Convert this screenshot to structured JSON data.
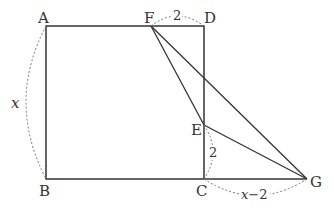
{
  "diagram": {
    "type": "geometry",
    "points": {
      "A": {
        "label": "A",
        "x": 46,
        "y": 26
      },
      "D": {
        "label": "D",
        "x": 204,
        "y": 26
      },
      "B": {
        "label": "B",
        "x": 46,
        "y": 179
      },
      "C": {
        "label": "C",
        "x": 204,
        "y": 179
      },
      "F": {
        "label": "F",
        "x": 151,
        "y": 26
      },
      "E": {
        "label": "E",
        "x": 204,
        "y": 125
      },
      "G": {
        "label": "G",
        "x": 307,
        "y": 179
      }
    },
    "measures": {
      "AB": "x",
      "FD": "2",
      "EC": "2",
      "CG": "x−2"
    },
    "colors": {
      "line": "#333333",
      "dashed": "#777777"
    }
  }
}
